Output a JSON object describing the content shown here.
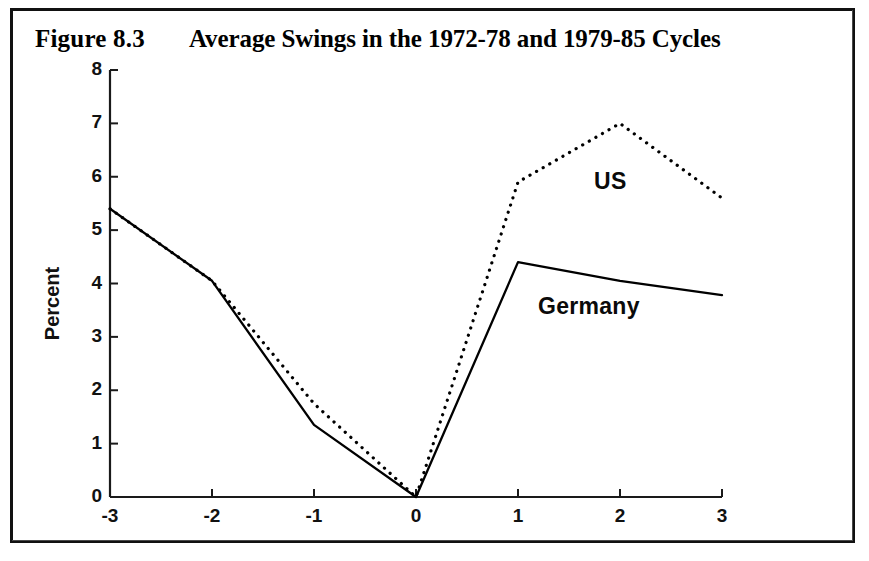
{
  "figure": {
    "number": "Figure 8.3",
    "title": "Average Swings in the 1972-78 and 1979-85 Cycles",
    "frame_color": "#111111",
    "background_color": "#ffffff"
  },
  "axes": {
    "y_title": "Percent",
    "y_ticks": [
      "8",
      "7",
      "6",
      "5",
      "4",
      "3",
      "2",
      "1",
      "0"
    ],
    "x_ticks": [
      "-3",
      "-2",
      "-1",
      "0",
      "1",
      "2",
      "3"
    ]
  },
  "series_labels": {
    "us": "US",
    "germany": "Germany"
  },
  "chart_data": {
    "type": "line",
    "title": "Average Swings in the 1972-78 and 1979-85 Cycles",
    "xlabel": "",
    "ylabel": "Percent",
    "x": [
      -3,
      -2,
      -1,
      0,
      1,
      2,
      3
    ],
    "xlim": [
      -3,
      3
    ],
    "ylim": [
      0,
      8
    ],
    "xticks": [
      -3,
      -2,
      -1,
      0,
      1,
      2,
      3
    ],
    "yticks": [
      0,
      1,
      2,
      3,
      4,
      5,
      6,
      7,
      8
    ],
    "grid": false,
    "legend": "inline-annotations",
    "series": [
      {
        "name": "US",
        "style": "dotted",
        "color": "#000000",
        "values": [
          5.4,
          4.05,
          1.75,
          0.0,
          5.9,
          7.0,
          5.6
        ]
      },
      {
        "name": "Germany",
        "style": "solid",
        "color": "#000000",
        "values": [
          5.4,
          4.05,
          1.35,
          0.0,
          4.4,
          4.05,
          3.78
        ]
      }
    ],
    "annotations": [
      {
        "text": "US",
        "x": 1.7,
        "y": 6.2
      },
      {
        "text": "Germany",
        "x": 1.15,
        "y": 3.8
      }
    ]
  }
}
